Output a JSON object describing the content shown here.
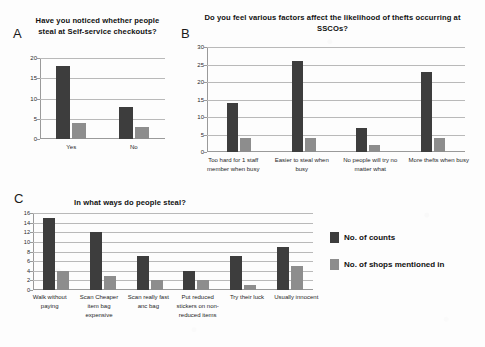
{
  "figure": {
    "background": "#fdfdfd",
    "dark_color": "#3d3d3d",
    "light_color": "#8d8d8d"
  },
  "legend": {
    "entries": [
      {
        "label": "No. of counts",
        "color": "#3d3d3d"
      },
      {
        "label": "No. of shops mentioned in",
        "color": "#8d8d8d"
      }
    ]
  },
  "panels": [
    {
      "letter": "A"
    },
    {
      "letter": "B"
    },
    {
      "letter": "C"
    }
  ],
  "chart_data": [
    {
      "type": "bar",
      "panel": "A",
      "title": "Have you noticed whether people steal at Self-service checkouts?",
      "categories": [
        "Yes",
        "No"
      ],
      "series": [
        {
          "name": "No. of counts",
          "values": [
            18,
            8
          ],
          "color": "#3d3d3d"
        },
        {
          "name": "No. of shops mentioned in",
          "values": [
            4,
            3
          ],
          "color": "#8d8d8d"
        }
      ],
      "xlabel": "",
      "ylabel": "",
      "ylim": [
        0,
        20
      ],
      "yticks": [
        0,
        5,
        10,
        15,
        20
      ],
      "grid": true,
      "legend_position": "shared-bottom-right"
    },
    {
      "type": "bar",
      "panel": "B",
      "title": "Do you feel various factors affect the likelihood of thefts occurring at SSCOs?",
      "categories": [
        "Too hard for 1 staff member when busy",
        "Easier to steal when busy",
        "No people will try no matter what",
        "More thefts when busy"
      ],
      "series": [
        {
          "name": "No. of counts",
          "values": [
            14,
            26,
            7,
            23
          ],
          "color": "#3d3d3d"
        },
        {
          "name": "No. of shops mentioned in",
          "values": [
            4,
            4,
            2,
            4
          ],
          "color": "#8d8d8d"
        }
      ],
      "xlabel": "",
      "ylabel": "",
      "ylim": [
        0,
        30
      ],
      "yticks": [
        0,
        5,
        10,
        15,
        20,
        25,
        30
      ],
      "grid": true,
      "legend_position": "shared-bottom-right"
    },
    {
      "type": "bar",
      "panel": "C",
      "title": "In what ways do people steal?",
      "categories": [
        "Walk without paying",
        "Scan Cheaper item bag expensive",
        "Scan really fast anc bag",
        "Put reduced stickers on non-reduced items",
        "Try their luck",
        "Usually innocent"
      ],
      "series": [
        {
          "name": "No. of counts",
          "values": [
            15,
            12,
            7,
            4,
            7,
            9
          ],
          "color": "#3d3d3d"
        },
        {
          "name": "No. of shops mentioned in",
          "values": [
            4,
            3,
            2,
            2,
            1,
            5
          ],
          "color": "#8d8d8d"
        }
      ],
      "xlabel": "",
      "ylabel": "",
      "ylim": [
        0,
        16
      ],
      "yticks": [
        0,
        2,
        4,
        6,
        8,
        10,
        12,
        14,
        16
      ],
      "grid": true,
      "legend_position": "right"
    }
  ]
}
